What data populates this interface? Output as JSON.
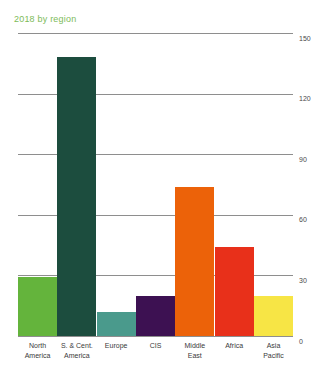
{
  "chart_data": {
    "type": "bar",
    "title": "2018 by region",
    "xlabel": "",
    "ylabel": "",
    "categories": [
      "North America",
      "S. & Cent. America",
      "Europe",
      "CIS",
      "Middle East",
      "Africa",
      "Asia Pacific"
    ],
    "category_lines": [
      [
        "North",
        "America"
      ],
      [
        "S. & Cent.",
        "America"
      ],
      [
        "Europe"
      ],
      [
        "CIS"
      ],
      [
        "Middle",
        "East"
      ],
      [
        "Africa"
      ],
      [
        "Asia",
        "Pacific"
      ]
    ],
    "values": [
      29,
      138,
      12,
      20,
      74,
      44,
      20
    ],
    "colors": [
      "#64B43C",
      "#1C4D3E",
      "#4A9A8C",
      "#3D1152",
      "#EC6209",
      "#E8301A",
      "#F7E545"
    ],
    "ylim": [
      0,
      150
    ],
    "yticks": [
      150,
      120,
      90,
      60,
      30,
      0
    ],
    "ytick_labels": [
      "150",
      "120",
      "90",
      "60",
      "30",
      "0"
    ],
    "grid": true,
    "legend": "none",
    "title_color": "#7DBB59",
    "gridline_color": "#8e8e8e",
    "axis_text_color": "#4a4a4a"
  }
}
